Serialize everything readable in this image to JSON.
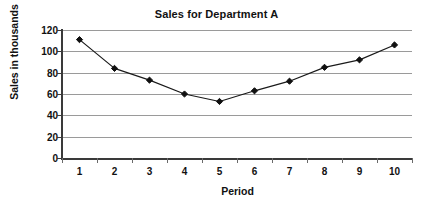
{
  "chart_data": {
    "type": "line",
    "title": "Sales for Department A",
    "xlabel": "Period",
    "ylabel": "Sales in thousands",
    "categories": [
      "1",
      "2",
      "3",
      "4",
      "5",
      "6",
      "7",
      "8",
      "9",
      "10"
    ],
    "values": [
      111,
      84,
      73,
      60,
      53,
      63,
      72,
      85,
      92,
      106
    ],
    "series": [
      {
        "name": "Sales for Department A",
        "values": [
          111,
          84,
          73,
          60,
          53,
          63,
          72,
          85,
          92,
          106
        ]
      }
    ],
    "ylim": [
      0,
      120
    ],
    "yticks": [
      0,
      20,
      40,
      60,
      80,
      100,
      120
    ],
    "ytick_labels": [
      "0",
      "20",
      "40",
      "60",
      "80",
      "100",
      "120"
    ],
    "xtick_labels": [
      "1",
      "2",
      "3",
      "4",
      "5",
      "6",
      "7",
      "8",
      "9",
      "10"
    ],
    "grid": "horizontal",
    "legend": "none",
    "marker": "diamond",
    "colors": {
      "line": "#1a1a1a",
      "marker": "#101010",
      "gridline": "#9a9a9a",
      "axis": "#3a3a3a",
      "text": "#111111",
      "background": "#ffffff"
    }
  }
}
